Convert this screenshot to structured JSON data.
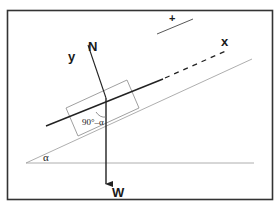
{
  "figure": {
    "labels": {
      "normal_force": "N",
      "weight": "W",
      "y_axis": "y",
      "x_axis": "x",
      "positive_direction": "+",
      "incline_angle": "α",
      "complement_angle": "90°–α"
    },
    "colors": {
      "frame": "#333333",
      "thin_lines": "#888888",
      "vectors": "#222222",
      "background": "#ffffff"
    }
  }
}
